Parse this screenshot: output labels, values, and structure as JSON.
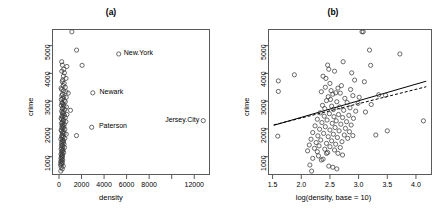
{
  "figure": {
    "panels": [
      {
        "id": "a",
        "title": "(a)",
        "xlabel": "density",
        "ylabel": "crime",
        "xticks": [
          "0",
          "2000",
          "4000",
          "6000",
          "8000",
          "",
          "12000"
        ],
        "xtick_values": [
          0,
          2000,
          4000,
          6000,
          8000,
          10000,
          12000
        ],
        "yticks": [
          "1000",
          "2000",
          "3000",
          "4000",
          "5000"
        ],
        "ytick_values": [
          1000,
          2000,
          3000,
          4000,
          5000
        ],
        "point_labels": [
          {
            "text": "New.York",
            "x": 5300,
            "y": 4700,
            "side": "right"
          },
          {
            "text": "Newark",
            "x": 3150,
            "y": 3300,
            "side": "right"
          },
          {
            "text": "Paterson",
            "x": 3100,
            "y": 2060,
            "side": "right"
          },
          {
            "text": "Jersey.City",
            "x": 12800,
            "y": 2300,
            "side": "left"
          }
        ]
      },
      {
        "id": "b",
        "title": "(b)",
        "xlabel": "log(density, base = 10)",
        "ylabel": "crime",
        "xticks": [
          "1.5",
          "2.0",
          "2.5",
          "3.0",
          "3.5",
          "4.0"
        ],
        "xtick_values": [
          1.5,
          2.0,
          2.5,
          3.0,
          3.5,
          4.0
        ],
        "yticks": [
          "1000",
          "2000",
          "3000",
          "4000",
          "5000"
        ],
        "ytick_values": [
          1000,
          2000,
          3000,
          4000,
          5000
        ],
        "lines": [
          {
            "name": "ols-fit",
            "style": "solid",
            "x1": 1.52,
            "y1": 2130,
            "x2": 4.18,
            "y2": 3720
          },
          {
            "name": "robust-fit",
            "style": "dashed",
            "x1": 1.52,
            "y1": 2145,
            "x2": 4.18,
            "y2": 3520
          }
        ]
      }
    ]
  },
  "chart_data": [
    {
      "type": "scatter",
      "panel": "a",
      "title": "(a)",
      "xlabel": "density",
      "ylabel": "crime",
      "xlim": [
        -620,
        13400
      ],
      "ylim": [
        340,
        5600
      ],
      "grid": false,
      "legend": "none",
      "marker": "open-circle",
      "annotations": [
        "New.York",
        "Newark",
        "Paterson",
        "Jersey.City"
      ],
      "x": [
        1140,
        1560,
        240,
        300,
        420,
        480,
        250,
        700,
        390,
        620,
        5300,
        2050,
        330,
        290,
        460,
        380,
        560,
        180,
        240,
        400,
        620,
        820,
        300,
        250,
        420,
        3000,
        640,
        330,
        200,
        470,
        560,
        270,
        310,
        380,
        210,
        440,
        660,
        350,
        290,
        520,
        1020,
        240,
        420,
        300,
        360,
        700,
        480,
        260,
        330,
        560,
        190,
        250,
        410,
        370,
        610,
        300,
        220,
        480,
        340,
        280,
        430,
        260,
        350,
        520,
        190,
        230,
        400,
        300,
        450,
        640,
        310,
        240,
        380,
        270,
        520,
        170,
        320,
        410,
        260,
        380,
        230,
        450,
        300,
        210,
        340,
        490,
        270,
        190,
        360,
        300,
        240,
        410,
        280,
        180,
        330,
        220,
        300,
        250,
        2900,
        1550,
        12800,
        170,
        260,
        330,
        220,
        150,
        300,
        190,
        250,
        140,
        380,
        200,
        290,
        160
      ],
      "y": [
        5500,
        4840,
        4420,
        4300,
        4150,
        4020,
        4080,
        4250,
        3900,
        3820,
        4700,
        4290,
        3760,
        3700,
        3640,
        3560,
        3500,
        3470,
        3420,
        3380,
        3340,
        3290,
        3250,
        3200,
        3160,
        3300,
        3140,
        3100,
        3060,
        3020,
        2980,
        2950,
        2920,
        2880,
        2850,
        2820,
        2790,
        2760,
        2730,
        2700,
        2670,
        2640,
        2610,
        2580,
        2550,
        2520,
        2490,
        2460,
        2440,
        2410,
        2380,
        2350,
        2320,
        2290,
        2260,
        2230,
        2200,
        2170,
        2140,
        2110,
        2080,
        2050,
        2020,
        1990,
        1960,
        1930,
        1900,
        1870,
        1840,
        1810,
        1780,
        1750,
        1720,
        1690,
        1660,
        1630,
        1600,
        1570,
        1540,
        1510,
        1480,
        1450,
        1420,
        1390,
        1360,
        1330,
        1300,
        1270,
        1240,
        1210,
        1180,
        1150,
        1120,
        1090,
        1060,
        1030,
        1000,
        970,
        2060,
        1760,
        2300,
        940,
        910,
        880,
        850,
        820,
        790,
        760,
        730,
        700,
        660,
        620,
        560,
        480
      ]
    },
    {
      "type": "scatter",
      "panel": "b",
      "title": "(b)",
      "xlabel": "log(density, base = 10)",
      "ylabel": "crime",
      "xlim": [
        1.42,
        4.28
      ],
      "ylim": [
        340,
        5600
      ],
      "grid": false,
      "legend": "none",
      "marker": "open-circle",
      "fit_lines": [
        {
          "name": "ols-fit",
          "style": "solid"
        },
        {
          "name": "robust-fit",
          "style": "dashed"
        }
      ],
      "x": [
        3.06,
        3.19,
        3.72,
        3.21,
        2.73,
        2.46,
        2.48,
        2.88,
        2.58,
        1.88,
        1.6,
        2.38,
        2.43,
        2.93,
        3.1,
        2.5,
        2.7,
        2.42,
        2.64,
        2.86,
        2.52,
        2.35,
        2.68,
        2.55,
        2.9,
        2.47,
        2.6,
        3.01,
        2.76,
        2.51,
        2.44,
        2.62,
        2.8,
        2.99,
        3.22,
        2.37,
        2.53,
        2.67,
        2.85,
        2.41,
        2.56,
        2.74,
        2.95,
        3.12,
        2.33,
        2.49,
        2.65,
        2.83,
        2.4,
        2.57,
        2.72,
        2.91,
        3.35,
        3.47,
        2.28,
        2.45,
        2.61,
        2.79,
        2.36,
        2.54,
        2.69,
        2.87,
        2.24,
        2.42,
        2.59,
        2.77,
        2.32,
        2.5,
        2.66,
        2.84,
        2.2,
        2.39,
        2.56,
        2.75,
        2.29,
        2.47,
        2.63,
        2.81,
        2.17,
        2.34,
        2.53,
        2.71,
        2.26,
        2.44,
        2.6,
        3.08,
        2.14,
        2.31,
        2.5,
        2.68,
        2.23,
        2.41,
        2.58,
        3.3,
        2.11,
        2.28,
        2.46,
        2.64,
        1.59,
        4.13,
        1.6,
        3.5,
        2.2,
        2.72,
        2.3,
        2.15,
        2.55,
        2.9,
        2.48,
        2.35,
        2.62,
        2.18,
        2.44,
        2.38
      ],
      "y": [
        5500,
        4840,
        4700,
        4290,
        4420,
        4300,
        4150,
        4020,
        4080,
        3950,
        3730,
        3900,
        3820,
        3760,
        3700,
        3640,
        3560,
        3500,
        3470,
        3420,
        3380,
        3340,
        3290,
        3250,
        3200,
        3160,
        3300,
        3140,
        3100,
        3060,
        3020,
        2980,
        2950,
        2920,
        2880,
        2850,
        2820,
        2790,
        2760,
        2730,
        2700,
        2670,
        2640,
        2610,
        2580,
        2550,
        2520,
        2490,
        2460,
        2440,
        2410,
        2380,
        3230,
        3210,
        2350,
        2320,
        2290,
        2260,
        2230,
        2200,
        2170,
        2140,
        2110,
        2080,
        2050,
        2020,
        1990,
        1960,
        1930,
        1900,
        1870,
        1840,
        1810,
        1780,
        1750,
        1720,
        1690,
        1660,
        1630,
        1600,
        1570,
        1540,
        1510,
        1480,
        1450,
        5500,
        1420,
        1390,
        1360,
        1330,
        1300,
        1270,
        1240,
        1780,
        1210,
        1180,
        1150,
        1120,
        1740,
        2290,
        3350,
        1930,
        940,
        1060,
        1030,
        700,
        620,
        1760,
        660,
        880,
        560,
        480,
        1120,
        910
      ]
    }
  ]
}
